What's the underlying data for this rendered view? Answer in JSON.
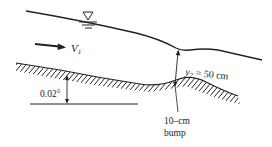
{
  "figure": {
    "labels": {
      "velocity": "V",
      "velocity_sub": "1",
      "depth": "y",
      "depth_sub": "2",
      "depth_value": " = 50 cm",
      "slope_angle": "0.02°",
      "bump_line1": "10–cm",
      "bump_line2": "bump"
    },
    "elements": {
      "free_surface": "water surface line",
      "water_level_symbol": "inverted triangle with hatch lines",
      "flow_arrow": "arrow pointing right",
      "channel_bed": "hatched sloping bed with bump",
      "horizontal_reference": "horizontal reference line",
      "depth_dimension": "double-headed arrow",
      "angle_dimension": "double-headed arrow"
    },
    "colors": {
      "ink": "#222222",
      "background": "#ffffff"
    }
  }
}
